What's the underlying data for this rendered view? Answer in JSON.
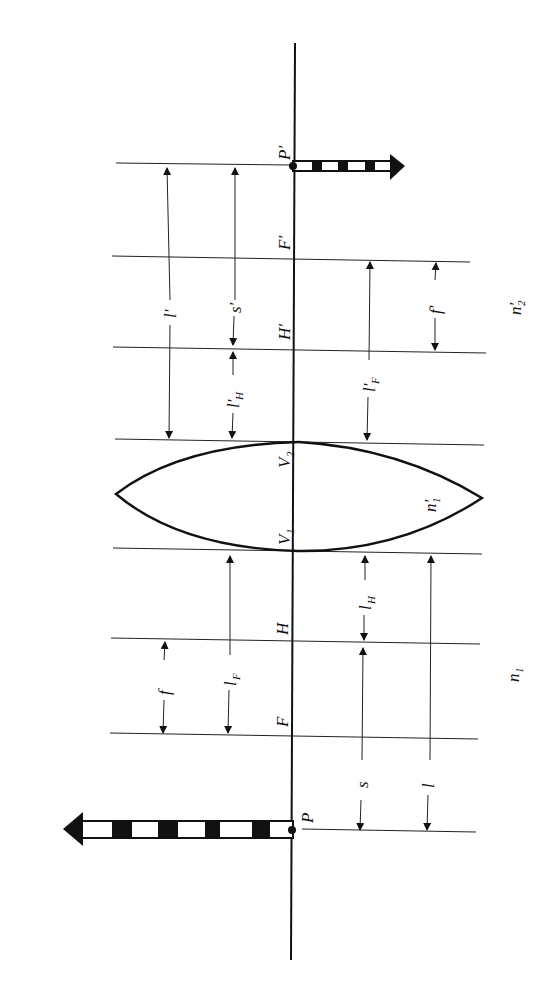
{
  "diagram": {
    "orientation": "rotated-90-ccw",
    "points": {
      "P": "P",
      "F": "F",
      "H": "H",
      "V1": "V",
      "V1_sub": "1",
      "V2": "V",
      "V2_sub": "2",
      "H_prime": "H′",
      "F_prime": "F′",
      "P_prime": "P′"
    },
    "media": {
      "n1": "n",
      "n1_sub": "1",
      "n1_prime": "n′",
      "n1_prime_sub": "1",
      "n2_prime": "n′",
      "n2_prime_sub": "2"
    },
    "dimensions": {
      "f": "f",
      "l_F": "l",
      "l_F_sub": "F",
      "s": "s",
      "l": "l",
      "l_H": "l",
      "l_H_sub": "H",
      "l_prime": "l′",
      "s_prime": "s′",
      "l_H_prime": "l′",
      "l_H_prime_sub": "H",
      "l_F_prime": "l′",
      "l_F_prime_sub": "F",
      "f_prime": "f′"
    }
  }
}
